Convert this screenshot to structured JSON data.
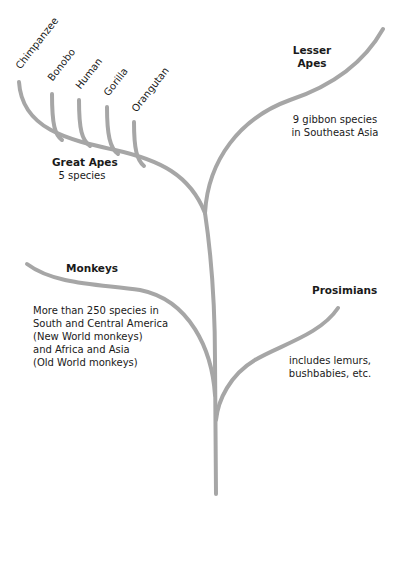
{
  "diagram": {
    "type": "phylogenetic-tree",
    "branch_color": "#a6a6a6",
    "species_tips": [
      "Chimpanzee",
      "Bonobo",
      "Human",
      "Gorilla",
      "Orangutan"
    ],
    "groups": {
      "great_apes": {
        "title": "Great Apes",
        "desc": "5 species"
      },
      "lesser_apes": {
        "title_line1": "Lesser",
        "title_line2": "Apes",
        "desc_line1": "9 gibbon species",
        "desc_line2": "in Southeast Asia"
      },
      "monkeys": {
        "title": "Monkeys",
        "desc_lines": [
          "More than 250 species in",
          "South and Central America",
          "(New World monkeys)",
          "and Africa and Asia",
          "(Old World monkeys)"
        ]
      },
      "prosimians": {
        "title": "Prosimians",
        "desc_line1": "includes lemurs,",
        "desc_line2": "bushbabies, etc."
      }
    }
  }
}
